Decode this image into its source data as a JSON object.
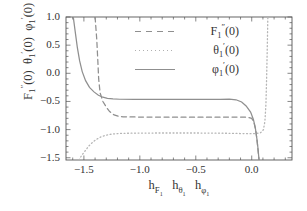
{
  "chart_data": {
    "type": "line",
    "title": "",
    "xlabel": "h_F1  h_theta1  h_phi1",
    "ylabel": "F1''(0)  theta1'(0)  phi1'(0)",
    "xlim": [
      -1.66,
      0.36
    ],
    "ylim": [
      -1.54,
      1.0
    ],
    "xticks": [
      -1.5,
      -1.0,
      -0.5,
      0.0
    ],
    "xticklabels": [
      "-1.5",
      "-1.0",
      "-0.5",
      "0.0"
    ],
    "yticks": [
      1.0,
      0.5,
      0.0,
      -0.5,
      -1.0,
      -1.5
    ],
    "yticklabels": [
      "1.0",
      "0.5",
      "0.0",
      "-0.5",
      "-1.0",
      "-1.5"
    ],
    "grid": false,
    "legend_position": "upper center",
    "series": [
      {
        "name": "F_1''(0)",
        "style": "dashed",
        "color": "#8f8f8f",
        "plateau_value": -0.77,
        "valid_range": [
          -1.28,
          -0.02
        ],
        "points": [
          [
            -1.4,
            1.0
          ],
          [
            -1.385,
            0.6
          ],
          [
            -1.375,
            0.2
          ],
          [
            -1.368,
            -0.1
          ],
          [
            -1.355,
            -0.35
          ],
          [
            -1.33,
            -0.5
          ],
          [
            -1.3,
            -0.6
          ],
          [
            -1.27,
            -0.68
          ],
          [
            -1.23,
            -0.74
          ],
          [
            -1.19,
            -0.765
          ],
          [
            -1.15,
            -0.772
          ],
          [
            -1.05,
            -0.776
          ],
          [
            -0.85,
            -0.778
          ],
          [
            -0.6,
            -0.779
          ],
          [
            -0.35,
            -0.779
          ],
          [
            -0.2,
            -0.778
          ],
          [
            -0.1,
            -0.777
          ],
          [
            -0.04,
            -0.78
          ],
          [
            0.0,
            -0.8
          ],
          [
            0.02,
            -0.87
          ],
          [
            0.035,
            -1.0
          ],
          [
            0.048,
            -1.2
          ],
          [
            0.058,
            -1.4
          ],
          [
            0.066,
            -1.54
          ]
        ]
      },
      {
        "name": "theta_1'(0)",
        "style": "dotted",
        "color": "#b5b5b5",
        "plateau_value": -1.06,
        "valid_range": [
          -1.4,
          0.1
        ],
        "points": [
          [
            -1.545,
            -1.54
          ],
          [
            -1.52,
            -1.46
          ],
          [
            -1.49,
            -1.38
          ],
          [
            -1.46,
            -1.3
          ],
          [
            -1.43,
            -1.24
          ],
          [
            -1.4,
            -1.19
          ],
          [
            -1.36,
            -1.14
          ],
          [
            -1.32,
            -1.11
          ],
          [
            -1.27,
            -1.085
          ],
          [
            -1.21,
            -1.072
          ],
          [
            -1.14,
            -1.066
          ],
          [
            -1.0,
            -1.062
          ],
          [
            -0.8,
            -1.06
          ],
          [
            -0.55,
            -1.06
          ],
          [
            -0.35,
            -1.062
          ],
          [
            -0.2,
            -1.066
          ],
          [
            -0.1,
            -1.07
          ],
          [
            -0.02,
            -1.072
          ],
          [
            0.04,
            -1.07
          ],
          [
            0.08,
            -1.055
          ],
          [
            0.105,
            -1.0
          ],
          [
            0.118,
            -0.85
          ],
          [
            0.127,
            -0.55
          ],
          [
            0.133,
            -0.1
          ],
          [
            0.139,
            0.45
          ],
          [
            0.144,
            1.0
          ]
        ]
      },
      {
        "name": "phi_1'(0)",
        "style": "solid",
        "color": "#8f8f8f",
        "plateau_value": -0.46,
        "valid_range": [
          -1.3,
          -0.05
        ],
        "points": [
          [
            -1.595,
            1.0
          ],
          [
            -1.575,
            0.7
          ],
          [
            -1.558,
            0.45
          ],
          [
            -1.538,
            0.22
          ],
          [
            -1.515,
            0.03
          ],
          [
            -1.485,
            -0.13
          ],
          [
            -1.45,
            -0.25
          ],
          [
            -1.41,
            -0.33
          ],
          [
            -1.37,
            -0.39
          ],
          [
            -1.33,
            -0.425
          ],
          [
            -1.29,
            -0.445
          ],
          [
            -1.24,
            -0.456
          ],
          [
            -1.18,
            -0.461
          ],
          [
            -1.05,
            -0.464
          ],
          [
            -0.85,
            -0.465
          ],
          [
            -0.6,
            -0.465
          ],
          [
            -0.4,
            -0.464
          ],
          [
            -0.28,
            -0.462
          ],
          [
            -0.2,
            -0.458
          ],
          [
            -0.14,
            -0.47
          ],
          [
            -0.09,
            -0.51
          ],
          [
            -0.05,
            -0.58
          ],
          [
            -0.01,
            -0.69
          ],
          [
            0.015,
            -0.82
          ],
          [
            0.033,
            -0.98
          ],
          [
            0.046,
            -1.16
          ],
          [
            0.057,
            -1.35
          ],
          [
            0.065,
            -1.54
          ]
        ]
      }
    ],
    "legend": [
      {
        "label_html": "F<sub>1</sub><sup>&#8243;</sup>(0)",
        "style": "dashed",
        "key": "F1pp"
      },
      {
        "label_html": "&#952;<sub>1</sub><sup>&#8242;</sup>(0)",
        "style": "dotted",
        "key": "theta1p"
      },
      {
        "label_html": "&#966;<sub>1</sub><sup>&#8242;</sup>(0)",
        "style": "solid",
        "key": "phi1p"
      }
    ],
    "axis_label_html": {
      "y": "F<sub>1</sub><sup>&#8243;</sup>(0)&nbsp; &#952;<sub>1</sub><sup>&#8242;</sup>(0)&nbsp; &#966;<sub>1</sub><sup>&#8242;</sup>(0)",
      "x": "h<sub>F<sub>1</sub></sub>&nbsp;&nbsp; h<sub>&#952;<sub>1</sub></sub>&nbsp;&nbsp; h<sub>&#966;<sub>1</sub></sub>"
    },
    "frame_color": "#555555",
    "text_color": "#333333"
  }
}
